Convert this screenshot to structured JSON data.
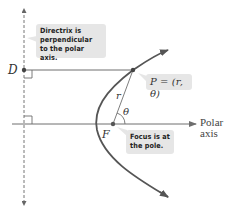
{
  "callouts": {
    "directrix": {
      "line1": "Directrix is",
      "line2": "perpendicular",
      "line3": "to the polar axis."
    },
    "point": "P = (r, θ)",
    "focus": {
      "line1": "Focus is at",
      "line2": "the pole."
    }
  },
  "labels": {
    "D": "D",
    "F": "F",
    "r": "r",
    "theta": "θ",
    "polar_axis_line1": "Polar",
    "polar_axis_line2": "axis"
  },
  "colors": {
    "line": "#6e6e6e",
    "curve": "#555555",
    "callout_bg": "#e6e6e6",
    "text": "#333333"
  }
}
